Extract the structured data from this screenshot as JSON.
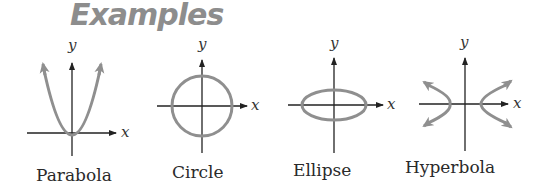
{
  "title": "Examples",
  "colors": {
    "curve": "#8f8f8f",
    "axis": "#222222",
    "title": "#8d8d8d"
  },
  "axis_labels": {
    "x": "x",
    "y": "y"
  },
  "examples": [
    {
      "name": "Parabola",
      "shape": "parabola"
    },
    {
      "name": "Circle",
      "shape": "circle"
    },
    {
      "name": "Ellipse",
      "shape": "ellipse"
    },
    {
      "name": "Hyperbola",
      "shape": "hyperbola"
    }
  ]
}
